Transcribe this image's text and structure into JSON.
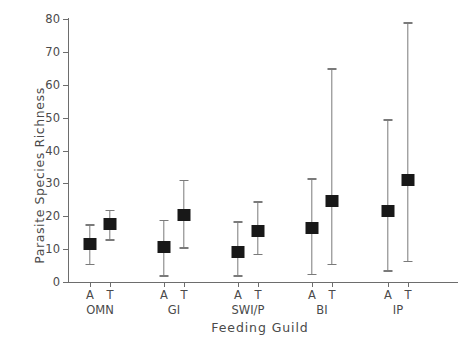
{
  "chart_data": {
    "type": "scatter",
    "title": "",
    "xlabel": "Feeding Guild",
    "ylabel": "Parasite Species Richness",
    "ylim": [
      0,
      80
    ],
    "yticks": [
      0,
      10,
      20,
      30,
      40,
      50,
      60,
      70,
      80
    ],
    "ytick_labels": [
      "0",
      "10",
      "20",
      "30",
      "40",
      "50",
      "60",
      "70",
      "80"
    ],
    "grid": false,
    "legend": "none",
    "categories": [
      "OMN",
      "GI",
      "SWI/P",
      "BI",
      "IP"
    ],
    "subcategory_labels": [
      "A",
      "T"
    ],
    "marker_style": "filled-square",
    "error_bar_style": "capped-whisker",
    "points": [
      {
        "guild": "OMN",
        "group": "A",
        "value": 11.5,
        "low": 5.5,
        "high": 17.5
      },
      {
        "guild": "OMN",
        "group": "T",
        "value": 17.5,
        "low": 13.0,
        "high": 22.0
      },
      {
        "guild": "GI",
        "group": "A",
        "value": 10.5,
        "low": 2.0,
        "high": 19.0
      },
      {
        "guild": "GI",
        "group": "T",
        "value": 20.5,
        "low": 10.5,
        "high": 31.0
      },
      {
        "guild": "SWI/P",
        "group": "A",
        "value": 9.0,
        "low": 2.0,
        "high": 18.5
      },
      {
        "guild": "SWI/P",
        "group": "T",
        "value": 15.5,
        "low": 8.5,
        "high": 24.5
      },
      {
        "guild": "BI",
        "group": "A",
        "value": 16.5,
        "low": 2.5,
        "high": 31.5
      },
      {
        "guild": "BI",
        "group": "T",
        "value": 24.5,
        "low": 5.5,
        "high": 65.0
      },
      {
        "guild": "IP",
        "group": "A",
        "value": 21.5,
        "low": 3.5,
        "high": 49.5
      },
      {
        "guild": "IP",
        "group": "T",
        "value": 31.0,
        "low": 6.5,
        "high": 79.0
      }
    ]
  },
  "colors": {
    "marker": "#181818",
    "error_bar": "#7a7a7a",
    "axis": "#6d6d6d",
    "text": "#4a4a4a",
    "background": "#ffffff"
  }
}
